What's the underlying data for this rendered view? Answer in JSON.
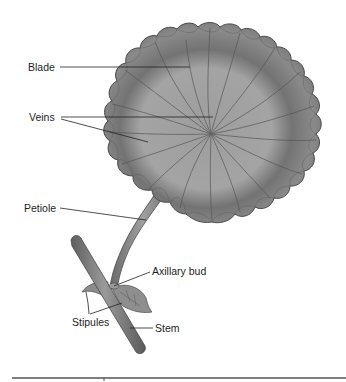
{
  "diagram": {
    "labels": {
      "blade": "Blade",
      "veins": "Veins",
      "petiole": "Petiole",
      "axillary_bud": "Axillary bud",
      "stipules": "Stipules",
      "stem": "Stem"
    },
    "colors": {
      "leaf_light": "#a3a3a3",
      "leaf_dark": "#6b6b6b",
      "leaf_outline": "#4a4a4a",
      "vein": "#5a5a5a",
      "stem": "#7a7a7a",
      "leader_line": "#222222",
      "rule": "#555555"
    }
  }
}
